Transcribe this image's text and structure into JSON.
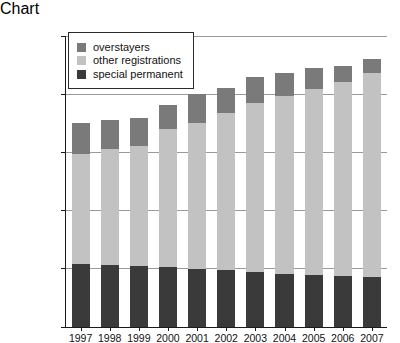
{
  "chart_data": {
    "type": "bar",
    "stacked": true,
    "title": "",
    "xlabel": "",
    "ylabel": "",
    "ylim": [
      0,
      2500000
    ],
    "ytick_values": [
      0,
      500000,
      1000000,
      1500000,
      2000000,
      2500000
    ],
    "ytick_labels": [
      "0",
      "500000",
      "1000000",
      "1500000",
      "2000000",
      "2500000"
    ],
    "grid": true,
    "legend_position": "top-left",
    "categories": [
      "1997",
      "1998",
      "1999",
      "2000",
      "2001",
      "2002",
      "2003",
      "2004",
      "2005",
      "2006",
      "2007"
    ],
    "series": [
      {
        "name": "special permanent",
        "color": "#3a3a3a",
        "values": [
          540000,
          530000,
          525000,
          515000,
          500000,
          490000,
          475000,
          460000,
          450000,
          440000,
          430000
        ]
      },
      {
        "name": "other registrations",
        "color": "#c2c2c2",
        "values": [
          950000,
          1000000,
          1030000,
          1185000,
          1260000,
          1350000,
          1455000,
          1530000,
          1600000,
          1670000,
          1760000
        ]
      },
      {
        "name": "overstayers",
        "color": "#7a7a7a",
        "values": [
          270000,
          250000,
          245000,
          210000,
          245000,
          220000,
          220000,
          200000,
          180000,
          140000,
          115000
        ]
      }
    ],
    "totals": [
      1760000,
      1780000,
      1800000,
      1910000,
      2005000,
      2060000,
      2150000,
      2190000,
      2230000,
      2250000,
      2305000
    ]
  },
  "legend": {
    "items": [
      {
        "label": "overstayers",
        "color": "#7a7a7a"
      },
      {
        "label": "other registrations",
        "color": "#c2c2c2"
      },
      {
        "label": "special permanent",
        "color": "#3a3a3a"
      }
    ]
  }
}
